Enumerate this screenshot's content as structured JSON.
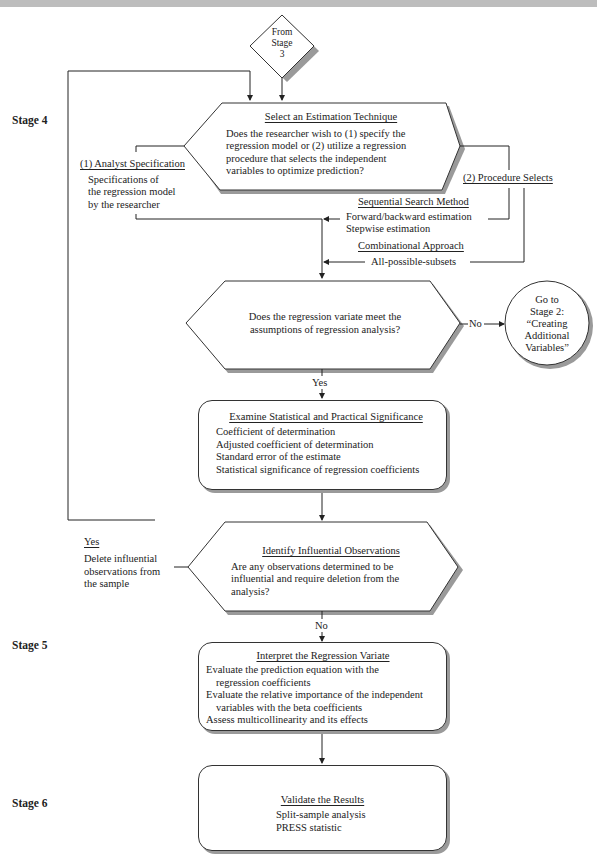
{
  "stages": {
    "stage4": "Stage 4",
    "stage5": "Stage 5",
    "stage6": "Stage 6"
  },
  "start": {
    "label_lines": [
      "From",
      "Stage",
      "3"
    ]
  },
  "select_technique": {
    "title": "Select an Estimation Technique",
    "lines": [
      "Does the researcher wish to (1) specify the",
      "regression model or (2) utilize a regression",
      "procedure that selects the independent",
      "variables to optimize prediction?"
    ]
  },
  "analyst_spec": {
    "title": "(1) Analyst Specification",
    "lines": [
      "Specifications of",
      "the regression model",
      "by the researcher"
    ]
  },
  "procedure_selects": {
    "title": "(2) Procedure Selects"
  },
  "sequential_search": {
    "title": "Sequential Search Method",
    "lines": [
      "Forward/backward estimation",
      "Stepwise estimation"
    ]
  },
  "combinational": {
    "title": "Combinational Approach",
    "lines": [
      "All-possible-subsets"
    ]
  },
  "assumptions": {
    "lines": [
      "Does the regression variate meet the",
      "assumptions of regression analysis?"
    ],
    "no_label": "No",
    "yes_label": "Yes"
  },
  "goto_stage2": {
    "lines": [
      "Go to",
      "Stage 2:",
      "“Creating",
      "Additional",
      "Variables”"
    ]
  },
  "significance": {
    "title": "Examine Statistical and Practical Significance",
    "lines": [
      "Coefficient of determination",
      "Adjusted coefficient of determination",
      "Standard error of the estimate",
      "Statistical significance of regression coefficients"
    ]
  },
  "influential": {
    "title": "Identify Influential Observations",
    "lines": [
      "Are any observations determined to be",
      "influential and require deletion from the",
      "analysis?"
    ],
    "yes_label": "Yes",
    "yes_lines": [
      "Delete influential",
      "observations from",
      "the sample"
    ],
    "no_label": "No"
  },
  "interpret": {
    "title": "Interpret the Regression Variate",
    "lines": [
      "Evaluate the prediction equation with the",
      "regression coefficients",
      "Evaluate the relative importance of the independent",
      "variables with the beta coefficients",
      "Assess multicollinearity and its effects"
    ]
  },
  "validate": {
    "title": "Validate the Results",
    "lines": [
      "Split-sample analysis",
      "PRESS statistic"
    ]
  }
}
